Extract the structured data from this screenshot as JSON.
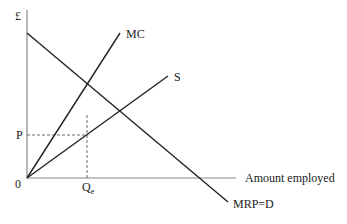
{
  "diagram": {
    "type": "monopsony-labour-market",
    "axes": {
      "y_label": "£",
      "x_label": "Amount employed",
      "origin_label": "0"
    },
    "curves": [
      {
        "id": "mc",
        "label": "MC",
        "from": [
          27,
          178
        ],
        "to": [
          120,
          33
        ]
      },
      {
        "id": "s",
        "label": "S",
        "from": [
          27,
          178
        ],
        "to": [
          168,
          76
        ]
      },
      {
        "id": "mrp",
        "label": "MRP=D",
        "from": [
          27,
          33
        ],
        "to": [
          228,
          202
        ]
      }
    ],
    "guides": {
      "price_label": "P",
      "quantity_label": "Q",
      "quantity_subscript": "e",
      "vertical_x": 87,
      "horizontal_y": 135
    },
    "colors": {
      "axis": "#888888",
      "line": "#222222",
      "text": "#222222"
    }
  }
}
